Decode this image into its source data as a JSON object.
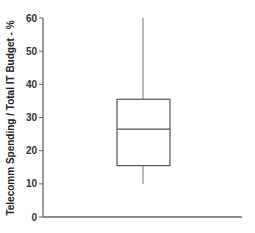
{
  "chart_data": {
    "type": "boxplot",
    "title": "",
    "xlabel": "",
    "ylabel": "Telecomm Spending / Total IT Budget - %",
    "ylim": [
      0,
      60
    ],
    "yticks": [
      0,
      10,
      20,
      30,
      40,
      50,
      60
    ],
    "grid": false,
    "legend": null,
    "series": [
      {
        "name": "",
        "whisker_low": 10,
        "q1": 15.5,
        "median": 26.5,
        "q3": 35.5,
        "whisker_high": 60
      }
    ]
  },
  "axis": {
    "y_title": "Telecomm Spending / Total IT Budget - %",
    "tick_labels": [
      "0",
      "10",
      "20",
      "30",
      "40",
      "50",
      "60"
    ]
  },
  "colors": {
    "axis": "#666666",
    "box": "#555555",
    "whisker": "#777777",
    "text": "#333333"
  }
}
